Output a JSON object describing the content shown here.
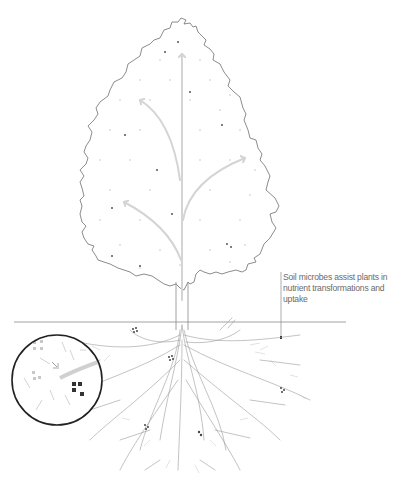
{
  "diagram": {
    "annotation": "Soil microbes assist plants in nutrient transformations and uptake",
    "elements": {
      "canopy": "tree-canopy-outline",
      "trunk": "tree-trunk",
      "arrows": [
        "up-arrow-center",
        "up-arrow-left",
        "up-arrow-right",
        "up-arrow-lower-left"
      ],
      "ground_line": "soil-surface-line",
      "roots": "root-system",
      "inset": "microbe-magnified-circle"
    },
    "colors": {
      "outline": "#6e6e6e",
      "arrow": "#d4d4d4",
      "dots_light": "#dcdcdc",
      "dots_dark": "#555555",
      "ground_line": "#8a8a8a",
      "roots": "#9a9a9a",
      "circle": "#222222",
      "caption": "#6a6a6a"
    }
  }
}
